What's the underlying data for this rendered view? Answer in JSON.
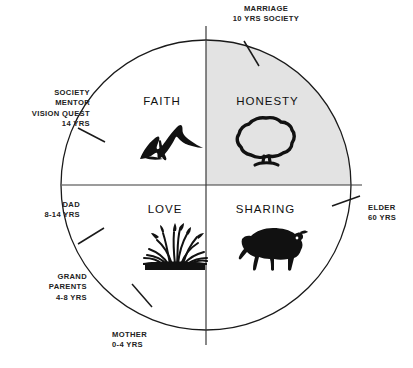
{
  "diagram": {
    "shape": "circle",
    "background_color": "#ffffff",
    "line_color": "#1a1a1a",
    "shaded_quadrant": "HONESTY",
    "shaded_quadrant_color": "#e3e3e3"
  },
  "quadrants": [
    {
      "id": "faith",
      "label": "FAITH",
      "icon": "mountains-icon",
      "position": "top-left",
      "shaded": false
    },
    {
      "id": "honesty",
      "label": "HONESTY",
      "icon": "tree-icon",
      "position": "top-right",
      "shaded": true
    },
    {
      "id": "love",
      "label": "LOVE",
      "icon": "grass-icon",
      "position": "bottom-left",
      "shaded": false
    },
    {
      "id": "sharing",
      "label": "SHARING",
      "icon": "buffalo-icon",
      "position": "bottom-right",
      "shaded": false
    }
  ],
  "outer_labels": [
    {
      "id": "marriage",
      "lines": "MARRIAGE\n10 YRS SOCIETY",
      "position": "top"
    },
    {
      "id": "society-mentor",
      "lines": "SOCIETY\nMENTOR\nVISION QUEST\n14 YRS",
      "position": "upper-left"
    },
    {
      "id": "dad",
      "lines": "DAD\n8-14 YRS",
      "position": "left"
    },
    {
      "id": "grandparents",
      "lines": "GRAND\nPARENTS\n4-8 YRS",
      "position": "lower-left"
    },
    {
      "id": "mother",
      "lines": "MOTHER\n0-4 YRS",
      "position": "bottom"
    },
    {
      "id": "elder",
      "lines": "ELDER\n60 YRS",
      "position": "right"
    }
  ]
}
